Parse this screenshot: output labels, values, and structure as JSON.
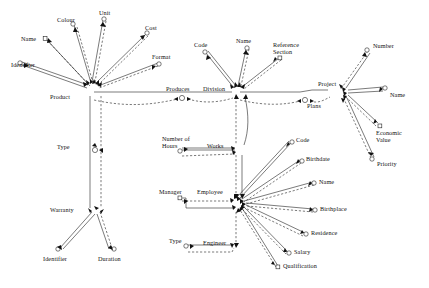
{
  "diagram": {
    "type": "entity-relationship-diagram",
    "title": "",
    "background_color": "#ffffff",
    "line_color": "#222222",
    "entities": [
      {
        "id": "product",
        "label": "Product",
        "x": 62,
        "y": 98,
        "attributes": [
          "Identifier",
          "Name",
          "Colour",
          "Unit",
          "Cost",
          "Format"
        ]
      },
      {
        "id": "division",
        "label": "Division",
        "x": 216,
        "y": 94,
        "attributes": [
          "Code",
          "Name",
          "Reference Section"
        ]
      },
      {
        "id": "project",
        "label": "Project",
        "x": 322,
        "y": 86,
        "attributes": [
          "Number",
          "Name",
          "Economic Value",
          "Priority"
        ]
      },
      {
        "id": "employee",
        "label": "Employee",
        "x": 203,
        "y": 192,
        "attributes": [
          "Code",
          "Birthdate",
          "Name",
          "Birthplace",
          "Residence",
          "Salary",
          "Qualification"
        ]
      },
      {
        "id": "warranty",
        "label": "Warranty",
        "x": 74,
        "y": 211,
        "attributes": [
          "Identifier",
          "Duration"
        ]
      }
    ],
    "relationships": [
      {
        "id": "produces",
        "label": "Produces",
        "x": 180,
        "y": 94
      },
      {
        "id": "plans",
        "label": "Plans",
        "x": 310,
        "y": 104
      },
      {
        "id": "works",
        "label": "Works",
        "x": 213,
        "y": 147
      },
      {
        "id": "manager",
        "label": "Manager",
        "x": 166,
        "y": 192
      },
      {
        "id": "engineer",
        "label": "Engineer",
        "x": 207,
        "y": 241
      },
      {
        "id": "type_product",
        "label": "Type",
        "x": 60,
        "y": 148
      },
      {
        "id": "type_engineer",
        "label": "Type",
        "x": 172,
        "y": 241
      },
      {
        "id": "number_of_hours",
        "label": "Number of\nHours",
        "x": 168,
        "y": 141
      }
    ],
    "attribute_nodes": [
      {
        "id": "attr-identifier-product",
        "label": "Identifier",
        "x": 11,
        "y": 64,
        "shape": "circle"
      },
      {
        "id": "attr-name-product",
        "label": "Name",
        "x": 36,
        "y": 38,
        "shape": "square"
      },
      {
        "id": "attr-colour",
        "label": "Colour",
        "x": 59,
        "y": 20,
        "shape": "circle"
      },
      {
        "id": "attr-unit",
        "label": "Unit",
        "x": 105,
        "y": 13,
        "shape": "circle"
      },
      {
        "id": "attr-cost",
        "label": "Cost",
        "x": 148,
        "y": 27,
        "shape": "circle"
      },
      {
        "id": "attr-format",
        "label": "Format",
        "x": 155,
        "y": 56,
        "shape": "circle"
      },
      {
        "id": "attr-code-division",
        "label": "Code",
        "x": 197,
        "y": 44,
        "shape": "circle"
      },
      {
        "id": "attr-name-division",
        "label": "Name",
        "x": 238,
        "y": 40,
        "shape": "circle"
      },
      {
        "id": "attr-reference-section",
        "label": "Reference\nSection",
        "x": 277,
        "y": 45,
        "shape": "square"
      },
      {
        "id": "attr-number-project",
        "label": "Number",
        "x": 371,
        "y": 45,
        "shape": "circle"
      },
      {
        "id": "attr-name-project",
        "label": "Name",
        "x": 383,
        "y": 92,
        "shape": "circle"
      },
      {
        "id": "attr-economic-value",
        "label": "Economic\nValue",
        "x": 378,
        "y": 128,
        "shape": "square"
      },
      {
        "id": "attr-priority",
        "label": "Priority",
        "x": 373,
        "y": 162,
        "shape": "circle"
      },
      {
        "id": "attr-code-employee",
        "label": "Code",
        "x": 294,
        "y": 138,
        "shape": "circle"
      },
      {
        "id": "attr-birthdate",
        "label": "Birthdate",
        "x": 303,
        "y": 156,
        "shape": "circle"
      },
      {
        "id": "attr-name-employee",
        "label": "Name",
        "x": 317,
        "y": 178,
        "shape": "circle"
      },
      {
        "id": "attr-birthplace",
        "label": "Birthplace",
        "x": 317,
        "y": 205,
        "shape": "circle"
      },
      {
        "id": "attr-residence",
        "label": "Residence",
        "x": 308,
        "y": 230,
        "shape": "circle"
      },
      {
        "id": "attr-salary",
        "label": "Salary",
        "x": 291,
        "y": 250,
        "shape": "circle"
      },
      {
        "id": "attr-qualification",
        "label": "Qualification",
        "x": 280,
        "y": 265,
        "shape": "square"
      },
      {
        "id": "attr-identifier-warranty",
        "label": "Identifier",
        "x": 46,
        "y": 252,
        "shape": "circle"
      },
      {
        "id": "attr-duration",
        "label": "Duration",
        "x": 95,
        "y": 252,
        "shape": "circle"
      }
    ]
  }
}
